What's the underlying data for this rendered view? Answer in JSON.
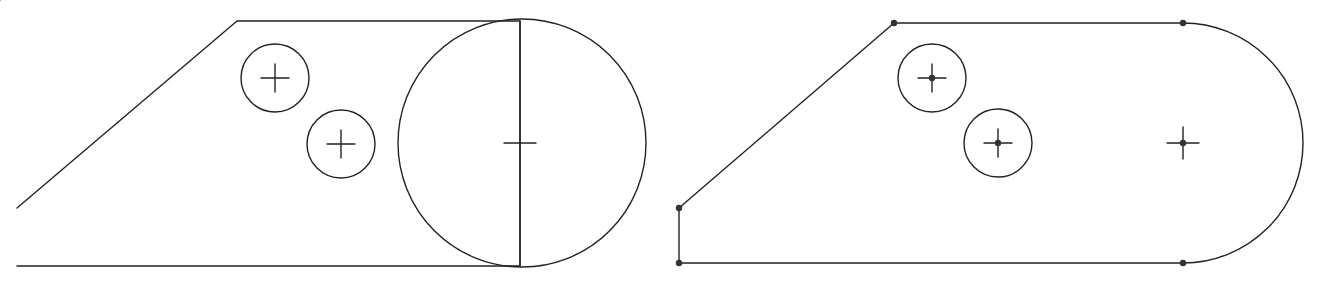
{
  "colors": {
    "background": "#ffffff",
    "line": "#222222",
    "vertex_dot": "#333333"
  },
  "diagrams": [
    {
      "id": "before",
      "description": "Sketch with full circle overlapping polygon end",
      "outline_points": [
        [
          17,
          208
        ],
        [
          237,
          21
        ],
        [
          520,
          21
        ],
        [
          520,
          266
        ],
        [
          17,
          266
        ]
      ],
      "large_circle": {
        "cx": 522,
        "cy": 143,
        "r": 124
      },
      "large_circle_center_mark": {
        "x": 520,
        "y": 143,
        "size": 16,
        "vertical": false
      },
      "divider_line": {
        "x1": 520,
        "y1": 21,
        "x2": 520,
        "y2": 266
      },
      "holes": [
        {
          "cx": 275,
          "cy": 78,
          "r": 34,
          "mark_size": 14
        },
        {
          "cx": 341,
          "cy": 144,
          "r": 34,
          "mark_size": 14
        }
      ],
      "vertex_dots": []
    },
    {
      "id": "after",
      "description": "Sketch after trim: rounded slot end with vertex points",
      "outline_path": "M 679 208 L 894 23 L 1183 23 A 120 120 0 0 1 1183 263 L 679 263 Z",
      "arc_center_mark": {
        "x": 1183,
        "y": 143,
        "size": 16
      },
      "holes": [
        {
          "cx": 932,
          "cy": 78,
          "r": 34,
          "mark_size": 14
        },
        {
          "cx": 998,
          "cy": 143,
          "r": 34,
          "mark_size": 14
        }
      ],
      "vertex_dots": [
        [
          679,
          208
        ],
        [
          894,
          23
        ],
        [
          1183,
          23
        ],
        [
          1183,
          263
        ],
        [
          679,
          263
        ],
        [
          932,
          78
        ],
        [
          998,
          143
        ],
        [
          1183,
          143
        ]
      ]
    }
  ]
}
